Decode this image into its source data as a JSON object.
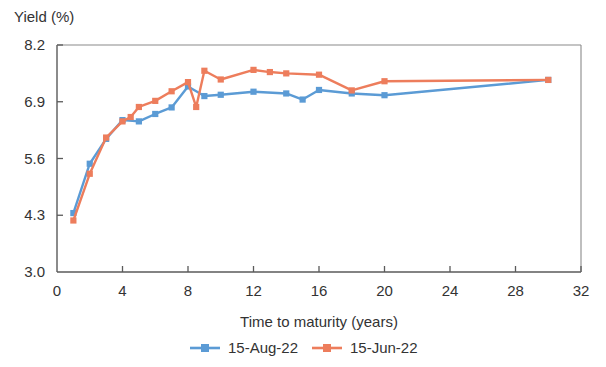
{
  "chart_data": {
    "type": "line",
    "title": "",
    "ylabel": "Yield (%)",
    "xlabel": "Time to maturity (years)",
    "xlim": [
      0,
      32
    ],
    "ylim": [
      3.0,
      8.2
    ],
    "xticks": [
      0,
      4,
      8,
      12,
      16,
      20,
      24,
      28,
      32
    ],
    "xtick_labels": [
      "0",
      "4",
      "8",
      "12",
      "16",
      "20",
      "24",
      "28",
      "32"
    ],
    "yticks": [
      3.0,
      4.3,
      5.6,
      6.9,
      8.2
    ],
    "ytick_labels": [
      "3.0",
      "4.3",
      "5.6",
      "6.9",
      "8.2"
    ],
    "grid": false,
    "legend_position": "bottom",
    "series": [
      {
        "name": "15-Aug-22",
        "color": "#5B9BD5",
        "marker": "square",
        "x": [
          1,
          2,
          3,
          4,
          5,
          6,
          7,
          8,
          9,
          10,
          12,
          14,
          15,
          16,
          18,
          20,
          30
        ],
        "y": [
          4.35,
          5.48,
          6.05,
          6.48,
          6.45,
          6.62,
          6.77,
          7.25,
          7.03,
          7.06,
          7.13,
          7.09,
          6.95,
          7.17,
          7.09,
          7.05,
          7.4
        ]
      },
      {
        "name": "15-Jun-22",
        "color": "#ED7D5C",
        "marker": "square",
        "x": [
          1,
          2,
          3,
          4,
          4.5,
          5,
          6,
          7,
          8,
          8.5,
          9,
          10,
          12,
          13,
          14,
          16,
          18,
          20,
          30
        ],
        "y": [
          4.18,
          5.25,
          6.08,
          6.45,
          6.55,
          6.78,
          6.92,
          7.14,
          7.35,
          6.78,
          7.61,
          7.41,
          7.63,
          7.58,
          7.55,
          7.52,
          7.16,
          7.37,
          7.4
        ]
      }
    ]
  },
  "legend": {
    "items": [
      {
        "label": "15-Aug-22",
        "color": "#5B9BD5"
      },
      {
        "label": "15-Jun-22",
        "color": "#ED7D5C"
      }
    ]
  }
}
